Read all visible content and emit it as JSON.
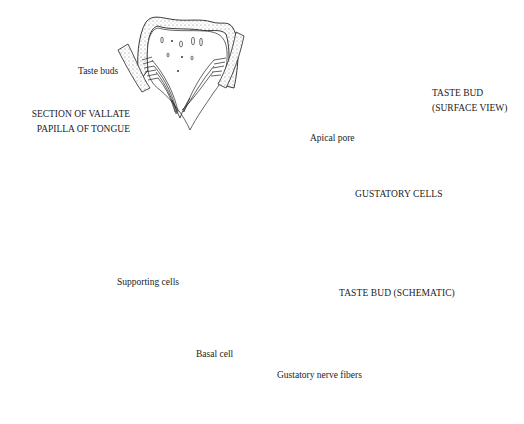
{
  "diagram": {
    "panels": {
      "section": {
        "title_line1": "SECTION OF VALLATE",
        "title_line2": "PAPILLA OF TONGUE",
        "label_taste_buds": "Taste buds"
      },
      "surface_view": {
        "title_line1": "TASTE BUD",
        "title_line2": "(SURFACE VIEW)"
      },
      "schematic": {
        "title": "TASTE BUD (SCHEMATIC)",
        "labels": {
          "apical_pore": "Apical pore",
          "gustatory_cells": "GUSTATORY CELLS",
          "supporting_cells": "Supporting cells",
          "basal_cell": "Basal cell",
          "gustatory_nerve_fibers": "Gustatory nerve fibers"
        }
      }
    },
    "colors": {
      "ink": "#222222",
      "stipple": "#9a9a9a",
      "background": "#ffffff"
    }
  }
}
